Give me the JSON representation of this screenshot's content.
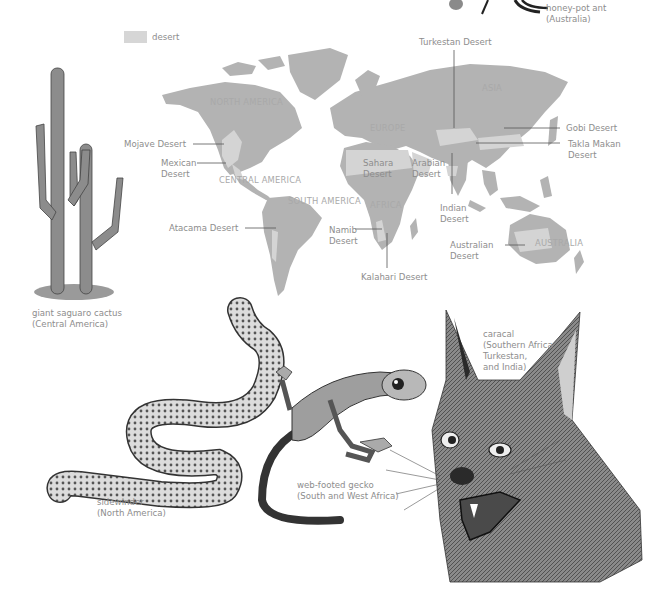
{
  "legend": {
    "swatch_color": "#d6d6d6",
    "label": "desert"
  },
  "colors": {
    "land": "#b3b3b3",
    "desert": "#d4d4d4",
    "label_text": "#8d8d8d",
    "continent_text": "#a9a9a9",
    "leader_line": "#555555"
  },
  "map": {
    "continents": [
      {
        "id": "north-america",
        "line1": "NORTH",
        "line2": "AMERICA"
      },
      {
        "id": "central-america",
        "line1": "CENTRAL AMERICA"
      },
      {
        "id": "south-america",
        "line1": "SOUTH",
        "line2": "AMERICA"
      },
      {
        "id": "europe",
        "line1": "EUROPE"
      },
      {
        "id": "asia",
        "line1": "ASIA"
      },
      {
        "id": "africa",
        "line1": "AFRICA"
      },
      {
        "id": "australia",
        "line1": "AUSTRALIA"
      }
    ],
    "deserts": [
      {
        "id": "mojave",
        "line1": "Mojave Desert"
      },
      {
        "id": "mexican",
        "line1": "Mexican",
        "line2": "Desert"
      },
      {
        "id": "atacama",
        "line1": "Atacama Desert"
      },
      {
        "id": "sahara",
        "line1": "Sahara",
        "line2": "Desert"
      },
      {
        "id": "arabian",
        "line1": "Arabian",
        "line2": "Desert"
      },
      {
        "id": "namib",
        "line1": "Namib",
        "line2": "Desert"
      },
      {
        "id": "kalahari",
        "line1": "Kalahari Desert"
      },
      {
        "id": "indian",
        "line1": "Indian",
        "line2": "Desert"
      },
      {
        "id": "turkestan",
        "line1": "Turkestan Desert"
      },
      {
        "id": "gobi",
        "line1": "Gobi Desert"
      },
      {
        "id": "takla-makan",
        "line1": "Takla Makan",
        "line2": "Desert"
      },
      {
        "id": "australian",
        "line1": "Australian",
        "line2": "Desert"
      }
    ]
  },
  "illustrations": [
    {
      "id": "honey-pot-ant",
      "name": "honey-pot ant",
      "region": "(Australia)"
    },
    {
      "id": "saguaro",
      "name": "giant saguaro cactus",
      "region": "(Central America)"
    },
    {
      "id": "caracal",
      "name": "caracal",
      "region_lines": [
        "(Southern Africa,",
        "Turkestan,",
        "and India)"
      ]
    },
    {
      "id": "sidewinder",
      "name": "sidewinder",
      "region": "(North America)"
    },
    {
      "id": "gecko",
      "name": "web-footed gecko",
      "region": "(South and West Africa)"
    }
  ]
}
